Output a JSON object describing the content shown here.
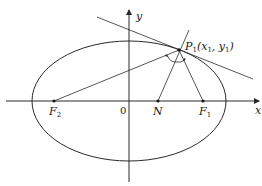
{
  "diagram": {
    "type": "ellipse-reflection-property",
    "axes": {
      "x_label": "x",
      "y_label": "y",
      "origin_label": "0"
    },
    "points": {
      "F2": {
        "label": "F",
        "subscript": "2"
      },
      "F1": {
        "label": "F",
        "subscript": "1"
      },
      "N": {
        "label": "N"
      },
      "P1": {
        "label": "P",
        "subscript": "1",
        "coords_text": "(x",
        "coords_x_sub": "1",
        "coords_mid": ", y",
        "coords_y_sub": "1",
        "coords_end": ")"
      }
    },
    "elements": [
      "ellipse",
      "x-axis",
      "y-axis",
      "tangent-line-at-P1",
      "normal-line-P1N",
      "focal-radius-P1F1",
      "focal-radius-P1F2",
      "equal-angle-arcs"
    ],
    "colors": {
      "stroke": "#2a2a2a",
      "background": "#ffffff"
    }
  }
}
